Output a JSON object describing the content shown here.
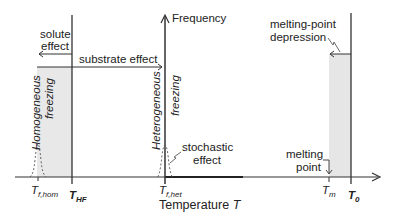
{
  "axes": {
    "y_label": "Frequency",
    "x_label": "Temperature",
    "x_symbol": "T"
  },
  "regions": {
    "homogeneous": {
      "label_line1": "Homogeneous",
      "label_line2": "freezing"
    },
    "heterogeneous": {
      "label_line1": "Heterogeneous",
      "label_line2": "freezing"
    }
  },
  "annotations": {
    "solute_effect": {
      "line1": "solute",
      "line2": "effect"
    },
    "substrate_effect": "substrate effect",
    "stochastic_effect": {
      "line1": "stochastic",
      "line2": "effect"
    },
    "melting_point_depression": {
      "line1": "melting-point",
      "line2": "depression"
    },
    "melting_point": {
      "line1": "melting",
      "line2": "point"
    }
  },
  "ticks": {
    "t_f_hom": {
      "main": "T",
      "sub": "f,hom"
    },
    "t_hf": {
      "main": "T",
      "sub": "HF"
    },
    "t_f_het": {
      "main": "T",
      "sub": "f,het"
    },
    "t_m": {
      "main": "T",
      "sub": "m"
    },
    "t_0": {
      "main": "T",
      "sub": "0"
    }
  },
  "colors": {
    "line": "#2a2a2a",
    "shade": "#e6e6e6",
    "text": "#222222"
  }
}
